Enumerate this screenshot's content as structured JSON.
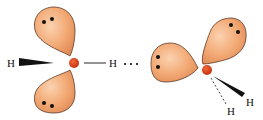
{
  "diagram": {
    "molecule_left": {
      "atom": "O",
      "hydrogen_wedge_label": "H",
      "bonded_hydrogen_label": "H",
      "lone_pairs": 2
    },
    "hbond": {
      "symbol": "· · ·"
    },
    "molecule_right": {
      "atom": "O",
      "hydrogen_wedge_label": "H",
      "hydrogen_dash_label": "H",
      "lone_pairs": 2
    },
    "colors": {
      "lobe_fill": "#f2a873",
      "lobe_stroke": "#5a3a2a",
      "oxygen": "#d9401a",
      "electron": "#111111",
      "bond": "#111111"
    }
  }
}
